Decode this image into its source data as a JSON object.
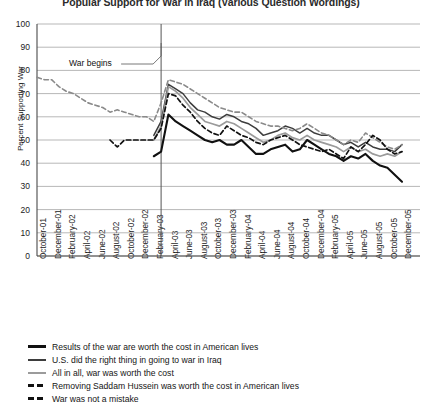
{
  "chart_data": {
    "type": "line",
    "title": "Popular Support for War in Iraq (Various Question Wordings)",
    "xlabel": "",
    "ylabel": "Percent Supporting War",
    "ylim": [
      0,
      100
    ],
    "ytick_step": 10,
    "yticks": [
      100,
      90,
      80,
      70,
      60,
      50,
      40,
      30,
      20,
      10,
      0
    ],
    "grid": "horizontal",
    "legend_position": "below-plot",
    "categories": [
      "October-01",
      "December-01",
      "February-02",
      "April-02",
      "June-02",
      "August-02",
      "October-02",
      "December-02",
      "February-03",
      "April-03",
      "June-03",
      "August-03",
      "October-03",
      "December-03",
      "February-04",
      "April-04",
      "June-04",
      "August-04",
      "October-04",
      "December-04",
      "February-05",
      "April-05",
      "June-05",
      "August-05",
      "October-05",
      "December-05"
    ],
    "annotations": [
      {
        "text": "War begins",
        "x_category": "March-03",
        "type": "vertical-line-with-label"
      }
    ],
    "series": [
      {
        "name": "Results of the war are worth the cost in American lives",
        "style": "solid",
        "color": "#111111",
        "width": 2.1,
        "x": [
          "February-03",
          "March-03",
          "April-03",
          "May-03",
          "June-03",
          "July-03",
          "August-03",
          "September-03",
          "October-03",
          "November-03",
          "December-03",
          "January-04",
          "February-04",
          "March-04",
          "April-04",
          "May-04",
          "June-04",
          "July-04",
          "August-04",
          "September-04",
          "October-04",
          "November-04",
          "December-04",
          "January-05",
          "February-05",
          "March-05",
          "April-05",
          "May-05",
          "June-05",
          "July-05",
          "August-05",
          "September-05",
          "October-05",
          "November-05",
          "December-05"
        ],
        "values": [
          43,
          45,
          61,
          58,
          56,
          54,
          52,
          50,
          49,
          50,
          48,
          48,
          50,
          47,
          44,
          44,
          46,
          47,
          48,
          45,
          46,
          50,
          48,
          46,
          44,
          43,
          41,
          43,
          42,
          44,
          41,
          39,
          38,
          35,
          32
        ]
      },
      {
        "name": "U.S. did the right thing in going to war in Iraq",
        "style": "solid",
        "color": "#3d3d3d",
        "width": 1.5,
        "x": [
          "February-03",
          "March-03",
          "April-03",
          "May-03",
          "June-03",
          "July-03",
          "August-03",
          "September-03",
          "October-03",
          "November-03",
          "December-03",
          "January-04",
          "February-04",
          "March-04",
          "April-04",
          "May-04",
          "June-04",
          "July-04",
          "August-04",
          "September-04",
          "October-04",
          "November-04",
          "December-04",
          "January-05",
          "February-05",
          "March-05",
          "April-05",
          "May-05",
          "June-05",
          "July-05",
          "August-05",
          "September-05",
          "October-05",
          "November-05",
          "December-05"
        ],
        "values": [
          52,
          58,
          74,
          72,
          70,
          66,
          63,
          62,
          60,
          59,
          61,
          60,
          58,
          57,
          55,
          52,
          53,
          54,
          56,
          55,
          53,
          55,
          53,
          52,
          52,
          50,
          48,
          49,
          47,
          49,
          47,
          46,
          46,
          45,
          48
        ]
      },
      {
        "name": "All in all, war was worth the cost",
        "style": "solid",
        "color": "#9b9b9b",
        "width": 1.7,
        "x": [
          "February-03",
          "March-03",
          "April-03",
          "May-03",
          "June-03",
          "July-03",
          "August-03",
          "September-03",
          "October-03",
          "November-03",
          "December-03",
          "January-04",
          "February-04",
          "March-04",
          "April-04",
          "May-04",
          "June-04",
          "July-04",
          "August-04",
          "September-04",
          "October-04",
          "November-04",
          "December-04",
          "January-05",
          "February-05",
          "March-05",
          "April-05",
          "May-05",
          "June-05",
          "July-05",
          "August-05",
          "September-05",
          "October-05",
          "November-05",
          "December-05"
        ],
        "values": [
          50,
          56,
          73,
          71,
          68,
          64,
          61,
          58,
          57,
          56,
          58,
          57,
          55,
          53,
          51,
          49,
          50,
          52,
          53,
          51,
          50,
          52,
          50,
          49,
          48,
          47,
          45,
          47,
          45,
          46,
          44,
          43,
          44,
          43,
          45
        ]
      },
      {
        "name": "Removing Saddam Hussein was worth the cost in American lives",
        "style": "dashed",
        "color": "#8a8a8a",
        "width": 1.6,
        "x": [
          "October-01",
          "November-01",
          "December-01",
          "January-02",
          "February-02",
          "March-02",
          "April-02",
          "May-02",
          "June-02",
          "July-02",
          "August-02",
          "September-02",
          "October-02",
          "November-02",
          "December-02",
          "January-03",
          "February-03",
          "March-03",
          "April-03",
          "May-03",
          "June-03",
          "July-03",
          "August-03",
          "September-03",
          "October-03",
          "November-03",
          "December-03",
          "January-04",
          "February-04",
          "March-04",
          "April-04",
          "May-04",
          "June-04",
          "July-04",
          "August-04",
          "September-04",
          "October-04",
          "November-04",
          "December-04",
          "January-05",
          "February-05",
          "March-05",
          "April-05",
          "May-05",
          "June-05",
          "July-05",
          "August-05",
          "September-05",
          "October-05",
          "November-05",
          "December-05"
        ],
        "values": [
          77,
          76,
          76,
          73,
          71,
          70,
          68,
          66,
          65,
          64,
          62,
          63,
          62,
          61,
          60,
          60,
          58,
          66,
          76,
          75,
          74,
          72,
          70,
          68,
          66,
          64,
          63,
          62,
          62,
          60,
          58,
          57,
          56,
          56,
          55,
          54,
          55,
          57,
          55,
          53,
          52,
          50,
          48,
          50,
          49,
          53,
          51,
          49,
          47,
          46,
          48
        ]
      },
      {
        "name": "War was not a mistake",
        "style": "dashed",
        "color": "#111111",
        "width": 1.7,
        "x": [
          "August-02",
          "September-02",
          "October-02",
          "November-02",
          "December-02",
          "January-03",
          "February-03",
          "March-03",
          "April-03",
          "May-03",
          "June-03",
          "July-03",
          "August-03",
          "September-03",
          "October-03",
          "November-03",
          "December-03",
          "January-04",
          "February-04",
          "March-04",
          "April-04",
          "May-04",
          "June-04",
          "July-04",
          "August-04",
          "September-04",
          "October-04",
          "November-04",
          "December-04",
          "January-05",
          "February-05",
          "March-05",
          "April-05",
          "May-05",
          "June-05",
          "July-05",
          "August-05",
          "September-05",
          "October-05",
          "November-05",
          "December-05"
        ],
        "values": [
          50,
          47,
          50,
          50,
          50,
          50,
          50,
          55,
          70,
          69,
          65,
          62,
          58,
          55,
          53,
          52,
          56,
          54,
          52,
          51,
          49,
          48,
          50,
          51,
          52,
          50,
          48,
          47,
          46,
          45,
          46,
          44,
          42,
          47,
          45,
          48,
          52,
          50,
          46,
          44,
          45
        ]
      }
    ]
  },
  "legend": {
    "items": [
      {
        "label": "Results of the war are worth the cost in American lives",
        "style": "solid",
        "color": "#111111",
        "width": 2.4
      },
      {
        "label": "U.S. did the right thing in going to war in Iraq",
        "style": "solid",
        "color": "#3d3d3d",
        "width": 2.0
      },
      {
        "label": "All in all, war was worth the cost",
        "style": "solid",
        "color": "#9b9b9b",
        "width": 2.0
      },
      {
        "label": "Removing Saddam Hussein was worth the cost in American lives",
        "style": "dashed",
        "color": "#111111",
        "width": 2.4
      },
      {
        "label": "War was not a mistake",
        "style": "dashed",
        "color": "#111111",
        "width": 2.4
      }
    ]
  },
  "axis": {
    "gridline_color": "#9a9a9a",
    "axis_color": "#4a4a4a"
  }
}
